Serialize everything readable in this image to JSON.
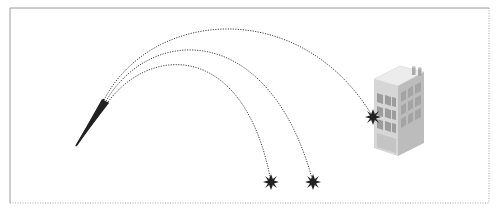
{
  "diagram": {
    "title": "",
    "frame": {
      "x": 10,
      "y": 8,
      "width": 479,
      "height": 195
    },
    "launcher": {
      "x1": 76,
      "y1": 146,
      "x2": 107,
      "y2": 98
    },
    "trajectories": [
      {
        "name": "trajectory-high",
        "target": "building",
        "path": "M104,100 C150,10 300,-5 373,117"
      },
      {
        "name": "trajectory-mid",
        "target": "ground-far",
        "path": "M106,101 C150,25 270,20 313,182"
      },
      {
        "name": "trajectory-low",
        "target": "ground-near",
        "path": "M108,102 C150,45 245,40 271,182"
      }
    ],
    "impacts": [
      {
        "name": "impact-building",
        "x": 373,
        "y": 117
      },
      {
        "name": "impact-ground-near",
        "x": 271,
        "y": 182
      },
      {
        "name": "impact-ground-far",
        "x": 313,
        "y": 182
      }
    ],
    "colors": {
      "line": "#333333",
      "frame": "#999999",
      "building_front": "#d9d9d9",
      "building_side": "#bdbdbd",
      "building_top": "#ededed",
      "window": "#9a9a9a"
    }
  }
}
